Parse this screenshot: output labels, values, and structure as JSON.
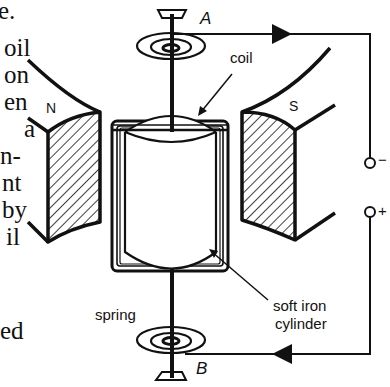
{
  "figure": {
    "type": "moving-coil galvanometer diagram",
    "labels": {
      "terminal_top": "A",
      "terminal_bottom": "B",
      "coil": "coil",
      "north_pole": "N",
      "south_pole": "S",
      "spring": "spring",
      "soft_iron_line1": "soft iron",
      "soft_iron_line2": "cylinder",
      "terminal_negative": "−",
      "terminal_positive": "+"
    },
    "colors": {
      "ink": "#111111",
      "background": "#ffffff"
    }
  },
  "clipped_text_fragments": [
    "e.",
    "oil",
    "on",
    "en",
    "a",
    "n-",
    "nt",
    "by",
    "il",
    "ed"
  ]
}
